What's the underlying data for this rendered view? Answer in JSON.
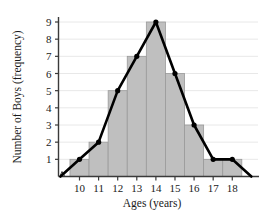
{
  "chart_data": {
    "type": "bar",
    "title": "",
    "xlabel": "Ages (years)",
    "ylabel": "Number of Boys (frequency)",
    "categories": [
      "10",
      "11",
      "12",
      "13",
      "14",
      "15",
      "16",
      "17",
      "18"
    ],
    "values": [
      1,
      2,
      5,
      7,
      9,
      6,
      3,
      1,
      1
    ],
    "x_tick_labels": [
      "10",
      "11",
      "12",
      "13",
      "14",
      "15",
      "16",
      "17",
      "18"
    ],
    "y_tick_labels": [
      "1",
      "2",
      "3",
      "4",
      "5",
      "6",
      "7",
      "8",
      "9"
    ],
    "y_ticks": [
      1,
      2,
      3,
      4,
      5,
      6,
      7,
      8,
      9
    ],
    "ylim": [
      0,
      9.6
    ],
    "xlim": [
      8.9,
      19.4
    ],
    "grid": true,
    "grid_axis": "y",
    "legend": false,
    "series": [
      {
        "name": "histogram",
        "type": "bar",
        "values": [
          1,
          2,
          5,
          7,
          9,
          6,
          3,
          1,
          1
        ],
        "color": "#bfbfbf",
        "edge_color": "#9a9a9a"
      },
      {
        "name": "frequency-polygon",
        "type": "line",
        "x": [
          9,
          10,
          11,
          12,
          13,
          14,
          15,
          16,
          17,
          18,
          19
        ],
        "values": [
          0,
          1,
          2,
          5,
          7,
          9,
          6,
          3,
          1,
          1,
          0
        ],
        "color": "#000000",
        "marker": "circle"
      }
    ],
    "annotations": [
      {
        "name": "y-axis-break",
        "symbol": "zigzag",
        "position": "origin"
      }
    ],
    "colors": {
      "bar_fill": "#bfbfbf",
      "bar_edge": "#9a9a9a",
      "line": "#000000",
      "grid": "#e8e8e8",
      "axis": "#3a3a3a",
      "text": "#1a1a1a",
      "background": "#ffffff"
    }
  }
}
